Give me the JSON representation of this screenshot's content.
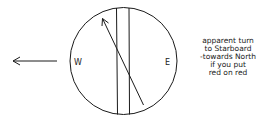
{
  "diagram": {
    "type": "compass-deviation-sketch",
    "compass": {
      "labels": {
        "west": "W",
        "east": "E"
      }
    },
    "direction_arrow": {
      "direction": "left"
    },
    "caption": {
      "lines": [
        "apparent turn",
        "to Starboard",
        "-towards North",
        "if you put",
        "red on red"
      ]
    },
    "colors": {
      "ink": "#1a1a1a",
      "background": "#ffffff"
    }
  }
}
